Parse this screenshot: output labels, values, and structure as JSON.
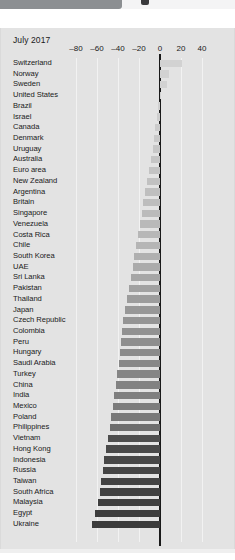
{
  "window": {
    "chrome_left_name": "browser-chrome-bar",
    "chrome_dot_name": "browser-chrome-indicator"
  },
  "chart_data": {
    "type": "bar",
    "orientation": "horizontal",
    "title": "July 2017",
    "xlabel": "",
    "ylabel": "",
    "xlim": [
      -90,
      50
    ],
    "xticks": [
      -80,
      -60,
      -40,
      -20,
      0,
      20,
      40
    ],
    "xtick_labels": [
      "–80",
      "–60",
      "–40",
      "–20",
      "0",
      "20",
      "40"
    ],
    "grid": true,
    "legend": "none",
    "categories": [
      "Switzerland",
      "Norway",
      "Sweden",
      "United States",
      "Brazil",
      "Israel",
      "Canada",
      "Denmark",
      "Uruguay",
      "Australia",
      "Euro area",
      "New Zealand",
      "Argentina",
      "Britain",
      "Singapore",
      "Venezuela",
      "Costa Rica",
      "Chile",
      "South Korea",
      "UAE",
      "Sri Lanka",
      "Pakistan",
      "Thailand",
      "Japan",
      "Czech Republic",
      "Colombia",
      "Peru",
      "Hungary",
      "Saudi Arabia",
      "Turkey",
      "China",
      "India",
      "Mexico",
      "Poland",
      "Philippines",
      "Vietnam",
      "Hong Kong",
      "Indonesia",
      "Russia",
      "Taiwan",
      "South Africa",
      "Malaysia",
      "Egypt",
      "Ukraine"
    ],
    "values": [
      20.5,
      9.0,
      6.5,
      0.0,
      -1.5,
      -2.5,
      -4.5,
      -5.5,
      -7.0,
      -8.5,
      -10.5,
      -12.0,
      -14.5,
      -16.5,
      -17.5,
      -19.5,
      -21.0,
      -22.5,
      -24.5,
      -26.0,
      -27.5,
      -29.5,
      -31.5,
      -33.5,
      -35.0,
      -36.5,
      -37.5,
      -38.5,
      -39.5,
      -40.5,
      -42.0,
      -43.5,
      -45.0,
      -46.5,
      -48.0,
      -50.0,
      -51.5,
      -53.0,
      -54.5,
      -56.0,
      -57.5,
      -59.5,
      -61.5,
      -64.5
    ],
    "bar_colors": [
      "#d2d2d2",
      "#d2d2d2",
      "#d2d2d2",
      "#d2d2d2",
      "#cfcfcf",
      "#cdcdcd",
      "#cbcbcb",
      "#c9c9c9",
      "#c7c7c7",
      "#c5c5c5",
      "#c3c3c3",
      "#c1c1c1",
      "#bfbfbf",
      "#bdbdbd",
      "#bbbbbb",
      "#b9b9b9",
      "#b7b7b7",
      "#b5b5b5",
      "#b0b0b0",
      "#ababab",
      "#a6a6a6",
      "#a1a1a1",
      "#9c9c9c",
      "#979797",
      "#949494",
      "#919191",
      "#8e8e8e",
      "#8b8b8b",
      "#888888",
      "#858585",
      "#828282",
      "#7f7f7f",
      "#7c7c7c",
      "#797979",
      "#6e6e6e",
      "#4e4e4e",
      "#494949",
      "#474747",
      "#454545",
      "#434343",
      "#414141",
      "#3f3f3f",
      "#3d3d3d",
      "#3b3b3b"
    ]
  }
}
